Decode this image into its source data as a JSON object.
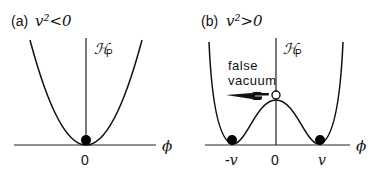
{
  "panels": [
    {
      "id": "a",
      "label": "(a)",
      "condition": "v²<0",
      "y_axis_label": "ℋ",
      "y_axis_sub": "P",
      "x_axis_label": "ϕ",
      "x_ticks": [
        "0"
      ],
      "minima": [
        "0"
      ],
      "shape": "single-well parabola"
    },
    {
      "id": "b",
      "label": "(b)",
      "condition": "v²>0",
      "y_axis_label": "ℋ",
      "y_axis_sub": "P",
      "x_axis_label": "ϕ",
      "x_ticks": [
        "-v",
        "0",
        "v"
      ],
      "minima": [
        "-v",
        "v"
      ],
      "annotation_line1": "false",
      "annotation_line2": "vacuum",
      "shape": "double-well (Mexican hat) potential"
    }
  ]
}
